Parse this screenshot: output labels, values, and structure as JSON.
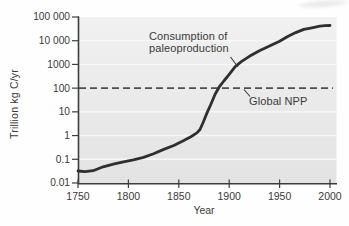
{
  "chart_data": {
    "type": "line",
    "title": "",
    "xlabel": "Year",
    "ylabel": "Trillion kg C/yr",
    "x_scale": "linear",
    "y_scale": "log",
    "xlim": [
      1750,
      2000
    ],
    "ylim": [
      0.01,
      100000
    ],
    "grid": "horizontal white gridlines at each decade, on gray plot background",
    "legend_position": "none",
    "x_ticks": [
      {
        "label": "1750",
        "value": 1750
      },
      {
        "label": "1800",
        "value": 1800
      },
      {
        "label": "1850",
        "value": 1850
      },
      {
        "label": "1900",
        "value": 1900
      },
      {
        "label": "1950",
        "value": 1950
      },
      {
        "label": "2000",
        "value": 2000
      }
    ],
    "y_ticks": [
      {
        "label": "100 000",
        "value": 100000
      },
      {
        "label": "10 000",
        "value": 10000
      },
      {
        "label": "1000",
        "value": 1000
      },
      {
        "label": "100",
        "value": 100
      },
      {
        "label": "10",
        "value": 10
      },
      {
        "label": "1",
        "value": 1
      },
      {
        "label": "0.1",
        "value": 0.1
      },
      {
        "label": "0.01",
        "value": 0.01
      }
    ],
    "gridline_values": [
      10000,
      1000,
      10,
      1,
      0.1
    ],
    "series": [
      {
        "name": "Consumption of paleoproduction",
        "x": [
          1750,
          1757,
          1765,
          1775,
          1785,
          1795,
          1805,
          1815,
          1825,
          1835,
          1845,
          1855,
          1862,
          1868,
          1871,
          1874,
          1878,
          1882,
          1886,
          1890,
          1895,
          1900,
          1906,
          1912,
          1920,
          1930,
          1940,
          1950,
          1958,
          1966,
          1974,
          1982,
          1990,
          1995,
          2000
        ],
        "y": [
          0.032,
          0.03,
          0.033,
          0.048,
          0.062,
          0.078,
          0.095,
          0.12,
          0.17,
          0.26,
          0.38,
          0.62,
          0.9,
          1.3,
          1.8,
          3.5,
          9,
          22,
          55,
          110,
          210,
          380,
          800,
          1300,
          2200,
          3800,
          6000,
          9500,
          15000,
          22000,
          30000,
          35000,
          41000,
          43000,
          44000
        ]
      }
    ],
    "reference_line": {
      "label": "Global NPP",
      "value": 100,
      "style": "dashed"
    },
    "annotations": {
      "curve_label_line1": "Consumption of",
      "curve_label_line2": "paleoproduction"
    },
    "colors": {
      "curve": "#2f2f2f",
      "axis": "#3d3d3d",
      "reference_line": "#4f4f4f",
      "plot_bg_top": "#f1f1f1",
      "plot_bg_bottom": "#e3e3e3",
      "gridline": "#f8f8f8",
      "text": "#3a3a3a",
      "page_bg": "#fefefe"
    }
  }
}
